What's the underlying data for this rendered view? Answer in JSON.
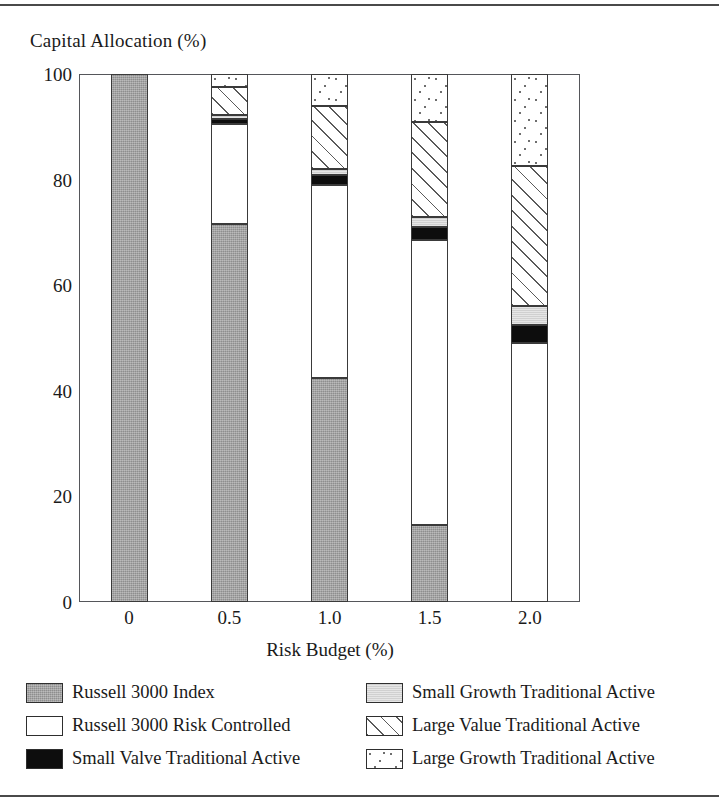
{
  "chart_data": {
    "type": "bar",
    "subtype": "stacked-bar-100pct",
    "title": "",
    "xlabel": "Risk Budget (%)",
    "ylabel": "Capital Allocation (%)",
    "categories": [
      "0",
      "0.5",
      "1.0",
      "1.5",
      "2.0"
    ],
    "x_tick_labels": [
      "0",
      "0.5",
      "1.0",
      "1.5",
      "2.0"
    ],
    "y_tick_labels": [
      "100",
      "80",
      "60",
      "40",
      "20",
      "0"
    ],
    "y_ticks": [
      100,
      80,
      60,
      40,
      20,
      0
    ],
    "ylim": [
      0,
      100
    ],
    "grid": false,
    "legend_position": "bottom",
    "series": [
      {
        "name": "Russell 3000 Index",
        "pattern": "solid-gray",
        "color": "#9e9e9e",
        "values": [
          100,
          71.5,
          42.5,
          14.5,
          0
        ]
      },
      {
        "name": "Russell 3000 Risk Controlled",
        "pattern": "white",
        "color": "#ffffff",
        "values": [
          0,
          19.0,
          36.5,
          54.0,
          49.0
        ]
      },
      {
        "name": "Small Valve Traditional Active",
        "pattern": "solid-black",
        "color": "#0d0d0d",
        "values": [
          0,
          1.0,
          1.8,
          2.5,
          3.5
        ]
      },
      {
        "name": "Small Growth Traditional Active",
        "pattern": "light-gray",
        "color": "#d8d8d8",
        "values": [
          0,
          0.8,
          1.2,
          2.0,
          3.5
        ]
      },
      {
        "name": "Large Value Traditional Active",
        "pattern": "diagonal-hatch",
        "color": "#ffffff",
        "values": [
          0,
          5.2,
          12.0,
          18.0,
          26.5
        ]
      },
      {
        "name": "Large Growth Traditional Active",
        "pattern": "dotted",
        "color": "#ffffff",
        "values": [
          0,
          2.5,
          6.0,
          9.0,
          17.5
        ]
      }
    ]
  },
  "axes": {
    "y_title": "Capital Allocation (%)",
    "x_title": "Risk Budget (%)"
  },
  "legend": {
    "items": [
      {
        "label": "Russell 3000 Index",
        "swatch": "fill-index"
      },
      {
        "label": "Small Growth Traditional Active",
        "swatch": "fill-smallgrowth"
      },
      {
        "label": "Russell 3000 Risk Controlled",
        "swatch": "fill-riskcontrolled"
      },
      {
        "label": "Large Value Traditional Active",
        "swatch": "fill-largevalue"
      },
      {
        "label": "Small Valve Traditional Active",
        "swatch": "fill-smallvalve"
      },
      {
        "label": "Large Growth Traditional Active",
        "swatch": "fill-largegrowth"
      }
    ]
  }
}
